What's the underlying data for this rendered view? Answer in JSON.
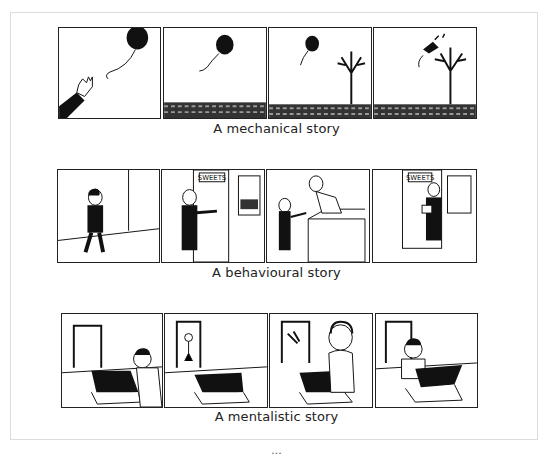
{
  "figure": {
    "stories": [
      {
        "caption": "A mechanical story",
        "panels": [
          {
            "description": "hand releasing a black balloon"
          },
          {
            "description": "balloon floating over cobbled ground"
          },
          {
            "description": "balloon drifting toward a bare tree"
          },
          {
            "description": "balloon bursts on tree branches"
          }
        ]
      },
      {
        "caption": "A behavioural story",
        "panels": [
          {
            "description": "girl walking"
          },
          {
            "description": "girl at shop door with SWEETS sign",
            "sign": "SWEETS"
          },
          {
            "description": "girl pays shopkeeper at counter"
          },
          {
            "description": "girl leaves shop holding sweets",
            "sign": "SWEETS"
          }
        ]
      },
      {
        "caption": "A mentalistic story",
        "panels": [
          {
            "description": "boy puts sweets in box"
          },
          {
            "description": "boy goes outside, box closed"
          },
          {
            "description": "mother eats sweets from box"
          },
          {
            "description": "boy returns, surprised box is empty"
          }
        ]
      }
    ],
    "bottom_caption": "..."
  },
  "colors": {
    "ink": "#1a1a1a",
    "frame": "#dcdcdc",
    "background": "#ffffff"
  }
}
